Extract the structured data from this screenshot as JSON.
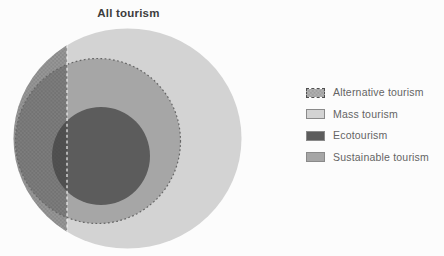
{
  "title": "All tourism",
  "diagram": {
    "background": "#fcfcfc",
    "regions": [
      {
        "id": "mass",
        "label": "Mass tourism",
        "shape": "ellipse",
        "cx": 127.5,
        "cy": 138.5,
        "rx": 114,
        "ry": 110,
        "fill": "#d3d3d3"
      },
      {
        "id": "sustainable",
        "label": "Sustainable tourism",
        "shape": "circle",
        "cx": 98,
        "cy": 141,
        "r": 82.5,
        "fill": "#a6a6a6",
        "stroke": "#666666",
        "stroke_style": "dotted"
      },
      {
        "id": "eco",
        "label": "Ecotourism",
        "shape": "circle",
        "cx": 101,
        "cy": 156,
        "r": 49,
        "fill": "#5c5c5c"
      },
      {
        "id": "alternative",
        "label": "Alternative tourism",
        "shape": "segment",
        "chord_x": 67,
        "pattern": "stipple",
        "dot_color": "#3e3e3e"
      }
    ],
    "divider": {
      "x": 67,
      "color": "#f0f0f0",
      "style": "dashed"
    }
  },
  "legend": {
    "text_color": "#646464",
    "items": [
      {
        "id": "alternative",
        "label": "Alternative tourism",
        "swatch": "stipple"
      },
      {
        "id": "mass",
        "label": "Mass tourism",
        "swatch": "#d3d3d3"
      },
      {
        "id": "eco",
        "label": "Ecotourism",
        "swatch": "#5c5c5c"
      },
      {
        "id": "sustainable",
        "label": "Sustainable tourism",
        "swatch": "#a6a6a6"
      }
    ]
  }
}
